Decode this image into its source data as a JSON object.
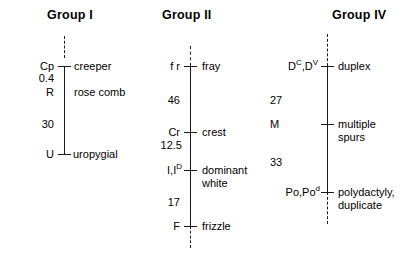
{
  "figure": {
    "type": "genetic-linkage-map",
    "background": "#ffffff",
    "line_color": "#1a1a1a"
  },
  "groups": [
    {
      "title": "Group I",
      "loci": [
        {
          "symbol": "Cp",
          "trait": "creeper"
        },
        {
          "symbol": "R",
          "trait": "rose comb"
        },
        {
          "symbol": "U",
          "trait": "uropygial"
        }
      ],
      "distances": [
        "0.4",
        "30"
      ]
    },
    {
      "title": "Group II",
      "loci": [
        {
          "symbol": "f r",
          "trait": "fray"
        },
        {
          "symbol": "Cr",
          "trait": "crest"
        },
        {
          "symbol": "I,I",
          "symbol_sup": "D",
          "trait": "dominant\nwhite"
        },
        {
          "symbol": "F",
          "trait": "frizzle"
        }
      ],
      "distances": [
        "46",
        "12.5",
        "17"
      ]
    },
    {
      "title": "Group IV",
      "loci": [
        {
          "symbol_a": "D",
          "symbol_a_sup": "C",
          "symbol_b": ",D",
          "symbol_b_sup": "V",
          "trait": "duplex"
        },
        {
          "symbol": "M",
          "trait": "multiple\nspurs"
        },
        {
          "symbol": "Po,Po",
          "symbol_sup": "d",
          "trait": "polydactyly,\nduplicate"
        }
      ],
      "distances": [
        "27",
        "33"
      ]
    }
  ]
}
